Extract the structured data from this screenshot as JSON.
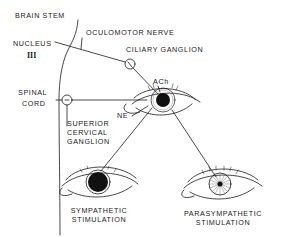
{
  "colors": {
    "background": "#ffffff",
    "ink": "#1a1a1a"
  },
  "labels": {
    "brain_stem": "BRAIN STEM",
    "oculomotor_nerve": "OCULOMOTOR NERVE",
    "nucleus": "NUCLEUS",
    "nucleus_number": "III",
    "ciliary_ganglion": "CILIARY GANGLION",
    "spinal_cord_line1": "SPINAL",
    "spinal_cord_line2": "CORD",
    "ach": "ACh",
    "ne": "NE",
    "scg_line1": "SUPERIOR",
    "scg_line2": "CERVICAL",
    "scg_line3": "GANGLION",
    "sympathetic_line1": "SYMPATHETIC",
    "sympathetic_line2": "STIMULATION",
    "parasympathetic_line1": "PARASYMPATHETIC",
    "parasympathetic_line2": "STIMULATION"
  },
  "structures": {
    "center_eye": {
      "state": "resting",
      "pupil": "medium"
    },
    "sympathetic_eye": {
      "state": "dilated",
      "pupil": "large"
    },
    "parasympathetic_eye": {
      "state": "constricted",
      "pupil": "small"
    }
  }
}
